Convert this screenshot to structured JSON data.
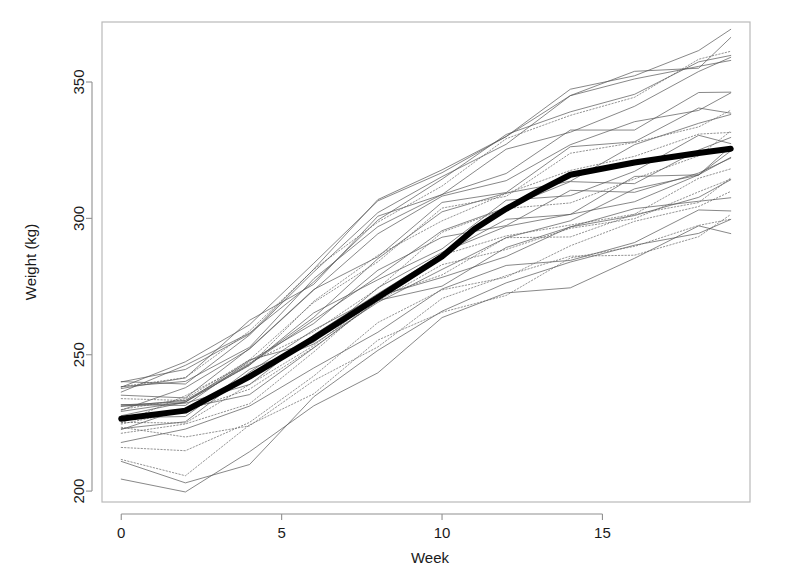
{
  "chart_data": {
    "type": "line",
    "title": "",
    "subtitle": "",
    "xlabel": "Week",
    "ylabel": "Weight (kg)",
    "xlim": [
      -0.6,
      19.6
    ],
    "ylim": [
      196,
      372
    ],
    "xticks": [
      0,
      5,
      10,
      15
    ],
    "yticks": [
      200,
      250,
      300,
      350
    ],
    "xtick_labels": [
      "0",
      "5",
      "10",
      "15"
    ],
    "ytick_labels": [
      "200",
      "250",
      "300",
      "350"
    ],
    "grid": false,
    "legend": "none",
    "frame": "box",
    "x": [
      0,
      2,
      4,
      6,
      8,
      10,
      12,
      14,
      16,
      18,
      19
    ],
    "mean_series": {
      "name": "Mean weight",
      "style": "solid",
      "color": "#000000",
      "linewidth": 6,
      "values": [
        226.5,
        229.5,
        242.0,
        256.0,
        271.0,
        286.0,
        296.0,
        303.5,
        310.0,
        316.0,
        320.5,
        324.0,
        325.5
      ]
    },
    "mean_x": [
      0,
      2,
      4,
      6,
      8,
      10,
      11,
      12,
      13,
      14,
      16,
      18,
      19
    ],
    "series": [
      {
        "name": "Animal 1",
        "style": "solid",
        "color": "#555555",
        "linewidth": 0.7,
        "values": [
          233,
          238,
          253,
          271,
          289,
          303,
          313,
          322,
          330,
          338,
          343
        ]
      },
      {
        "name": "Animal 2",
        "style": "solid",
        "color": "#555555",
        "linewidth": 0.7,
        "values": [
          231,
          234,
          248,
          265,
          281,
          293,
          303,
          311,
          318,
          326,
          330
        ]
      },
      {
        "name": "Animal 3",
        "style": "solid",
        "color": "#555555",
        "linewidth": 0.7,
        "values": [
          238,
          243,
          259,
          280,
          298,
          313,
          325,
          334,
          341,
          351,
          357
        ]
      },
      {
        "name": "Animal 4",
        "style": "dotted",
        "color": "#666666",
        "linewidth": 0.7,
        "values": [
          227,
          231,
          246,
          262,
          277,
          292,
          301,
          310,
          318,
          325,
          329
        ]
      },
      {
        "name": "Animal 5",
        "style": "solid",
        "color": "#555555",
        "linewidth": 0.7,
        "values": [
          224,
          227,
          241,
          256,
          272,
          285,
          294,
          303,
          310,
          318,
          322
        ]
      },
      {
        "name": "Animal 6",
        "style": "dotted",
        "color": "#666666",
        "linewidth": 0.7,
        "values": [
          236,
          241,
          257,
          277,
          297,
          314,
          327,
          337,
          346,
          356,
          361
        ]
      },
      {
        "name": "Animal 7",
        "style": "solid",
        "color": "#555555",
        "linewidth": 0.7,
        "values": [
          240,
          244,
          261,
          282,
          303,
          321,
          334,
          344,
          352,
          362,
          368
        ]
      },
      {
        "name": "Animal 8",
        "style": "solid",
        "color": "#555555",
        "linewidth": 0.7,
        "values": [
          229,
          232,
          245,
          259,
          273,
          286,
          294,
          301,
          307,
          314,
          318
        ]
      },
      {
        "name": "Animal 9",
        "style": "dotted",
        "color": "#666666",
        "linewidth": 0.7,
        "values": [
          221,
          224,
          236,
          251,
          267,
          280,
          289,
          297,
          303,
          310,
          314
        ]
      },
      {
        "name": "Animal 10",
        "style": "solid",
        "color": "#555555",
        "linewidth": 0.7,
        "values": [
          234,
          239,
          254,
          273,
          291,
          306,
          317,
          326,
          333,
          341,
          346
        ]
      },
      {
        "name": "Animal 11",
        "style": "solid",
        "color": "#555555",
        "linewidth": 0.7,
        "values": [
          217,
          219,
          229,
          243,
          258,
          271,
          279,
          287,
          293,
          300,
          304
        ]
      },
      {
        "name": "Animal 12",
        "style": "dotted",
        "color": "#666666",
        "linewidth": 0.7,
        "values": [
          215,
          212,
          224,
          241,
          258,
          272,
          282,
          290,
          296,
          303,
          307
        ]
      },
      {
        "name": "Animal 13",
        "style": "solid",
        "color": "#555555",
        "linewidth": 0.7,
        "values": [
          232,
          236,
          250,
          268,
          285,
          299,
          309,
          317,
          324,
          332,
          337
        ]
      },
      {
        "name": "Animal 14",
        "style": "solid",
        "color": "#555555",
        "linewidth": 0.7,
        "values": [
          228,
          230,
          243,
          258,
          274,
          287,
          296,
          304,
          311,
          318,
          322
        ]
      },
      {
        "name": "Animal 15",
        "style": "dotted",
        "color": "#666666",
        "linewidth": 0.7,
        "values": [
          226,
          228,
          240,
          254,
          268,
          280,
          288,
          295,
          301,
          307,
          311
        ]
      },
      {
        "name": "Animal 16",
        "style": "solid",
        "color": "#555555",
        "linewidth": 0.7,
        "values": [
          237,
          242,
          258,
          279,
          299,
          316,
          329,
          339,
          347,
          355,
          360
        ]
      },
      {
        "name": "Animal 17",
        "style": "solid",
        "color": "#555555",
        "linewidth": 0.7,
        "values": [
          230,
          233,
          247,
          263,
          279,
          292,
          301,
          309,
          316,
          323,
          327
        ]
      },
      {
        "name": "Animal 18",
        "style": "dotted",
        "color": "#666666",
        "linewidth": 0.7,
        "values": [
          219,
          216,
          227,
          242,
          257,
          269,
          277,
          284,
          289,
          296,
          299
        ]
      },
      {
        "name": "Animal 19",
        "style": "solid",
        "color": "#555555",
        "linewidth": 0.7,
        "values": [
          209,
          203,
          214,
          231,
          248,
          262,
          272,
          281,
          288,
          295,
          299
        ]
      },
      {
        "name": "Animal 20",
        "style": "solid",
        "color": "#555555",
        "linewidth": 0.7,
        "values": [
          235,
          240,
          256,
          275,
          293,
          308,
          319,
          328,
          336,
          344,
          349
        ]
      },
      {
        "name": "Animal 21",
        "style": "dotted",
        "color": "#666666",
        "linewidth": 0.7,
        "values": [
          222,
          225,
          238,
          254,
          270,
          283,
          292,
          300,
          306,
          313,
          317
        ]
      },
      {
        "name": "Animal 22",
        "style": "solid",
        "color": "#555555",
        "linewidth": 0.7,
        "values": [
          227,
          229,
          241,
          255,
          269,
          281,
          289,
          296,
          302,
          308,
          312
        ]
      },
      {
        "name": "Animal 23",
        "style": "solid",
        "color": "#555555",
        "linewidth": 0.7,
        "values": [
          239,
          243,
          260,
          281,
          301,
          318,
          331,
          341,
          349,
          357,
          362
        ]
      },
      {
        "name": "Animal 24",
        "style": "dotted",
        "color": "#666666",
        "linewidth": 0.7,
        "values": [
          230,
          234,
          249,
          267,
          284,
          298,
          308,
          316,
          323,
          330,
          334
        ]
      },
      {
        "name": "Animal 25",
        "style": "solid",
        "color": "#555555",
        "linewidth": 0.7,
        "values": [
          225,
          227,
          239,
          253,
          267,
          279,
          287,
          294,
          300,
          306,
          310
        ]
      },
      {
        "name": "Animal 26",
        "style": "solid",
        "color": "#555555",
        "linewidth": 0.7,
        "values": [
          202,
          199,
          210,
          227,
          245,
          260,
          270,
          279,
          286,
          293,
          297
        ]
      },
      {
        "name": "Animal 27",
        "style": "dotted",
        "color": "#666666",
        "linewidth": 0.7,
        "values": [
          233,
          237,
          252,
          270,
          287,
          301,
          311,
          320,
          327,
          334,
          339
        ]
      },
      {
        "name": "Animal 28",
        "style": "solid",
        "color": "#555555",
        "linewidth": 0.7,
        "values": [
          228,
          231,
          245,
          261,
          277,
          290,
          299,
          307,
          313,
          320,
          324
        ]
      },
      {
        "name": "Animal 29",
        "style": "solid",
        "color": "#555555",
        "linewidth": 0.7,
        "values": [
          241,
          245,
          262,
          283,
          302,
          319,
          332,
          342,
          350,
          358,
          365
        ]
      },
      {
        "name": "Animal 30",
        "style": "dotted",
        "color": "#666666",
        "linewidth": 0.7,
        "values": [
          213,
          210,
          222,
          238,
          254,
          267,
          276,
          284,
          290,
          296,
          300
        ]
      }
    ]
  }
}
